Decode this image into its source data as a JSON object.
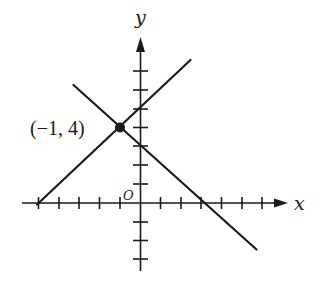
{
  "diagram": {
    "type": "coordinate-plane",
    "axes": {
      "x_label": "x",
      "y_label": "y",
      "origin_label": "O",
      "x_ticks": [
        -5,
        -4,
        -3,
        -2,
        -1,
        1,
        2,
        3,
        4,
        5,
        6
      ],
      "y_ticks": [
        -3,
        -2,
        -1,
        1,
        2,
        3,
        4,
        5,
        6,
        7
      ]
    },
    "lines": [
      {
        "name": "increasing-line",
        "equation": "y = x + 5",
        "slope": 1,
        "y_intercept": 5,
        "x_intercept": -5
      },
      {
        "name": "decreasing-line",
        "equation": "y = -x + 3",
        "slope": -1,
        "y_intercept": 3,
        "x_intercept": 3
      }
    ],
    "intersection": {
      "x": -1,
      "y": 4,
      "label": "(−1, 4)"
    },
    "colors": {
      "ink": "#1a1a1a",
      "background": "#ffffff"
    }
  }
}
